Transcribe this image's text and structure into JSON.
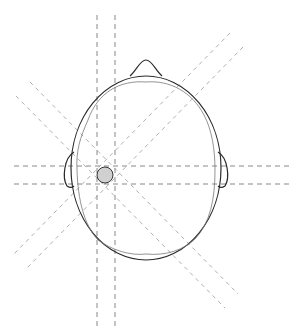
{
  "diagram": {
    "colors": {
      "outline": "#2a2a2a",
      "dashed_lines": "#7a7a7a",
      "tumor_fill": "#d0d0d0",
      "background": "#ffffff"
    },
    "head": {
      "cx": 146,
      "cy": 170,
      "rx": 76,
      "ry": 90
    },
    "tumor": {
      "cx": 105,
      "cy": 175,
      "r": 8
    },
    "beams": [
      {
        "x1": 97,
        "y1": 15,
        "x2": 97,
        "y2": 326
      },
      {
        "x1": 115,
        "y1": 15,
        "x2": 115,
        "y2": 326
      },
      {
        "x1": 14,
        "y1": 166,
        "x2": 290,
        "y2": 166
      },
      {
        "x1": 14,
        "y1": 184,
        "x2": 290,
        "y2": 184
      },
      {
        "x1": 230,
        "y1": 33,
        "x2": 14,
        "y2": 254
      },
      {
        "x1": 243,
        "y1": 47,
        "x2": 27,
        "y2": 268
      },
      {
        "x1": 16,
        "y1": 96,
        "x2": 225,
        "y2": 308
      },
      {
        "x1": 30,
        "y1": 82,
        "x2": 238,
        "y2": 294
      }
    ]
  }
}
